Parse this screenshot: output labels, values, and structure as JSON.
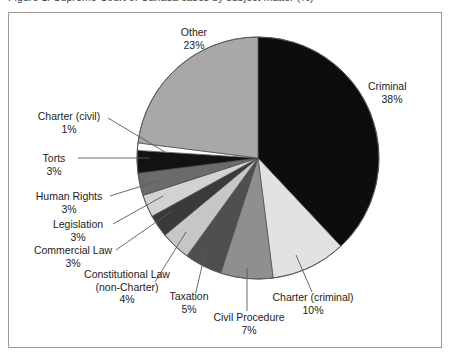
{
  "page": {
    "cropped_caption": "Figure 1: Supreme Court of Canada cases by subject matter (%)"
  },
  "frame": {
    "border_color": "#9a9a9a"
  },
  "chart_data": {
    "type": "pie",
    "title": "",
    "subtitle": "",
    "xlabel": "",
    "ylabel": "",
    "legend_position": "none",
    "grid": false,
    "units": "percent",
    "start_angle_deg": 0,
    "direction": "clockwise",
    "categories": [
      "Criminal",
      "Charter (criminal)",
      "Civil Procedure",
      "Taxation",
      "Constitutional Law (non-Charter)",
      "Commercial Law",
      "Legislation",
      "Human Rights",
      "Torts",
      "Charter (civil)",
      "Other"
    ],
    "values": [
      38,
      10,
      7,
      5,
      4,
      3,
      3,
      3,
      3,
      1,
      23
    ],
    "colors": [
      "#0d0d0d",
      "#e2e2e2",
      "#8f8f8f",
      "#4f4f4f",
      "#c6c6c6",
      "#3a3a3a",
      "#d2d2d2",
      "#6b6b6b",
      "#121212",
      "#fbfbfb",
      "#a8a8a8"
    ],
    "slice_labels": [
      {
        "name": "Criminal",
        "value_text": "38%"
      },
      {
        "name": "Charter (criminal)",
        "value_text": "10%"
      },
      {
        "name": "Civil Procedure",
        "value_text": "7%"
      },
      {
        "name": "Taxation",
        "value_text": "5%"
      },
      {
        "name": "Constitutional Law (non-Charter)",
        "value_text": "4%"
      },
      {
        "name": "Commercial Law",
        "value_text": "3%"
      },
      {
        "name": "Legislation",
        "value_text": "3%"
      },
      {
        "name": "Human Rights",
        "value_text": "3%"
      },
      {
        "name": "Torts",
        "value_text": "3%"
      },
      {
        "name": "Charter (civil)",
        "value_text": "1%"
      },
      {
        "name": "Other",
        "value_text": "23%"
      }
    ]
  },
  "labels": {
    "other": {
      "name": "Other",
      "value": "23%"
    },
    "criminal": {
      "name": "Criminal",
      "value": "38%"
    },
    "charter_crim": {
      "name": "Charter (criminal)",
      "value": "10%"
    },
    "civil_proc": {
      "name": "Civil Procedure",
      "value": "7%"
    },
    "taxation": {
      "name": "Taxation",
      "value": "5%"
    },
    "const_law_1": {
      "name": "Constitutional Law",
      "name2": "(non-Charter)",
      "value": "4%"
    },
    "commercial": {
      "name": "Commercial Law",
      "value": "3%"
    },
    "legislation": {
      "name": "Legislation",
      "value": "3%"
    },
    "human_rights": {
      "name": "Human Rights",
      "value": "3%"
    },
    "torts": {
      "name": "Torts",
      "value": "3%"
    },
    "charter_civ": {
      "name": "Charter (civil)",
      "value": "1%"
    }
  }
}
